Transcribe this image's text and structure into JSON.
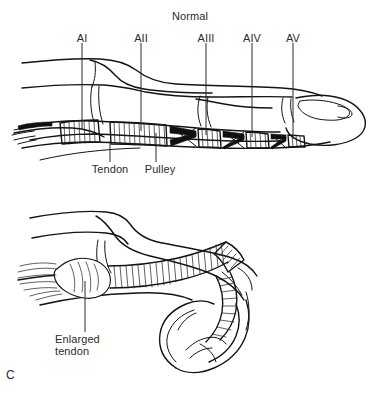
{
  "figure": {
    "letter": "C",
    "background_color": "#ffffff",
    "ink_color": "#141414"
  },
  "panels": [
    {
      "id": "normal-finger",
      "title": "Normal",
      "labels": [
        {
          "key": "a1",
          "text": "AI"
        },
        {
          "key": "a2",
          "text": "AII"
        },
        {
          "key": "a3",
          "text": "AIII"
        },
        {
          "key": "a4",
          "text": "AIV"
        },
        {
          "key": "a5",
          "text": "AV"
        },
        {
          "key": "tendon",
          "text": "Tendon"
        },
        {
          "key": "pulley",
          "text": "Pulley"
        }
      ]
    },
    {
      "id": "trigger-finger",
      "title": "",
      "labels": [
        {
          "key": "enlarged-tendon-line1",
          "text": "Enlarged"
        },
        {
          "key": "enlarged-tendon-line2",
          "text": "tendon"
        }
      ]
    }
  ]
}
